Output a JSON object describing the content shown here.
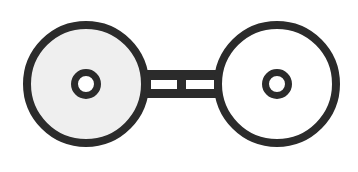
{
  "diagram": {
    "title": "",
    "colors": {
      "stroke": "#2b2b2b",
      "left_fill": "#efefef",
      "right_fill": "#ffffff",
      "background": "#ffffff"
    },
    "nodes": [
      {
        "id": "left-wheel",
        "shape": "circle",
        "filled": true,
        "inner": "ring"
      },
      {
        "id": "right-wheel",
        "shape": "circle",
        "filled": false,
        "inner": "ring"
      }
    ],
    "connector": {
      "type": "double-bar",
      "slots": 2
    }
  }
}
